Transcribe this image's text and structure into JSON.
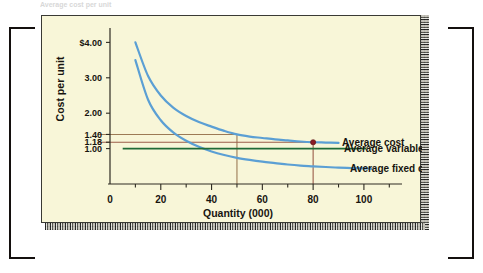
{
  "figure": {
    "panel_bg": "#f8f6d8",
    "top_sliver_text": "Average cost per unit"
  },
  "chart_data": {
    "type": "line",
    "title": "",
    "xlabel": "Quantity (000)",
    "ylabel": "Cost per unit",
    "xlim": [
      0,
      115
    ],
    "ylim": [
      0,
      4.35
    ],
    "grid": false,
    "legend_position": "right-inline",
    "x_ticks": [
      "0",
      "20",
      "40",
      "60",
      "80",
      "100"
    ],
    "x_tick_values": [
      0,
      20,
      40,
      60,
      80,
      100
    ],
    "x_minor_step": 10,
    "y_ticks": [
      "$4.00",
      "3.00",
      "2.00",
      "1.40",
      "1.18",
      "1.00"
    ],
    "y_tick_values": [
      4.0,
      3.0,
      2.0,
      1.4,
      1.18,
      1.0
    ],
    "series": [
      {
        "name": "Average cost",
        "color": "#5b9fd4",
        "x": [
          10,
          15,
          20,
          25,
          30,
          35,
          40,
          45,
          50,
          55,
          60,
          65,
          70,
          75,
          80,
          85,
          90
        ],
        "values": [
          4.0,
          3.05,
          2.5,
          2.15,
          1.92,
          1.75,
          1.62,
          1.5,
          1.4,
          1.34,
          1.3,
          1.26,
          1.23,
          1.2,
          1.18,
          1.17,
          1.16
        ]
      },
      {
        "name": "Average fixed cost",
        "color": "#5b9fd4",
        "x": [
          10,
          15,
          20,
          25,
          30,
          35,
          40,
          45,
          50,
          55,
          60,
          65,
          70,
          75,
          80,
          85,
          90,
          95,
          100,
          103
        ],
        "values": [
          3.5,
          2.38,
          1.8,
          1.45,
          1.22,
          1.05,
          0.92,
          0.82,
          0.74,
          0.68,
          0.63,
          0.59,
          0.55,
          0.52,
          0.5,
          0.48,
          0.46,
          0.45,
          0.44,
          0.43
        ]
      },
      {
        "name": "Average variable cost",
        "color": "#1f6b36",
        "type": "horizontal-line",
        "x": [
          5,
          101
        ],
        "values": [
          1.0,
          1.0
        ]
      }
    ],
    "annotations": [
      {
        "name": "guide-140",
        "color": "#9c7a55",
        "y_value": 1.4,
        "x_value": 50,
        "description": "horizontal guide at 1.40 to quantity 50, vertical drop to axis"
      },
      {
        "name": "guide-118",
        "color": "#9b5d4a",
        "y_value": 1.18,
        "x_value": 80,
        "description": "horizontal guide at 1.18 to quantity 80, vertical drop to axis"
      }
    ],
    "markers": [
      {
        "name": "average-cost-point",
        "x": 80,
        "y": 1.18,
        "color": "#8b1c24",
        "on_series": "Average cost"
      }
    ]
  },
  "labels": {
    "average_cost": "Average cost",
    "average_variable_cost": "Average variable cost",
    "average_fixed_cost": "Average fixed cost"
  }
}
